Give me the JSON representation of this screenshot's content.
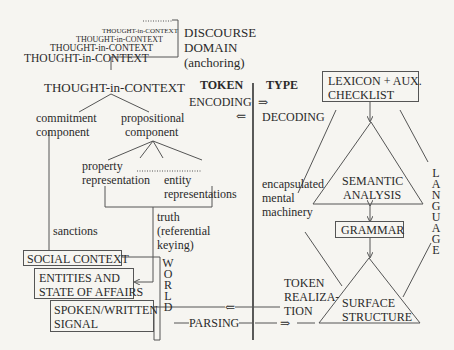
{
  "discourse": {
    "stack": [
      "THOUGHT-in-CONTEXT",
      "THOUGHT-in-CONTEXT",
      "THOUGHT-in-CONTEXT",
      "THOUGHT-in-CONTEXT"
    ],
    "label_line1": "DISCOURSE",
    "label_line2": "DOMAIN",
    "label_line3": "(anchoring)"
  },
  "thought": {
    "title": "THOUGHT-in-CONTEXT",
    "commitment_1": "commitment",
    "commitment_2": "component",
    "propositional_1": "propositional",
    "propositional_2": "component",
    "property_1": "property",
    "property_2": "representation",
    "entity_1": "entity",
    "entity_2": "representations",
    "truth_1": "truth",
    "truth_2": "(referential",
    "truth_3": "keying)",
    "sanctions": "sanctions"
  },
  "world": {
    "social_context": "SOCIAL CONTEXT",
    "entities_1": "ENTITIES AND",
    "entities_2": "STATE OF AFFAIRS",
    "signal_1": "SPOKEN/WRITTEN",
    "signal_2": "SIGNAL",
    "label": "WORLD"
  },
  "middle": {
    "token": "TOKEN",
    "type": "TYPE",
    "encoding": "ENCODING",
    "decoding": "DECODING",
    "arrow_right": "⇒",
    "arrow_left": "⇐",
    "encapsulated_1": "encapsulated",
    "encapsulated_2": "mental",
    "encapsulated_3": "machinery",
    "token_realization_1": "TOKEN",
    "token_realization_2": "REALIZA-",
    "token_realization_3": "TION",
    "parsing": "PARSING"
  },
  "language": {
    "lexicon_1": "LEXICON + AUX.",
    "lexicon_2": "CHECKLIST",
    "semantic_1": "SEMANTIC",
    "semantic_2": "ANALYSIS",
    "grammar": "GRAMMAR",
    "surface_1": "SURFACE",
    "surface_2": "STRUCTURE",
    "label": "LANGUAGE"
  },
  "colors": {
    "background": "#f6f5f1",
    "ink": "#2a2a2a",
    "line": "#555555"
  }
}
